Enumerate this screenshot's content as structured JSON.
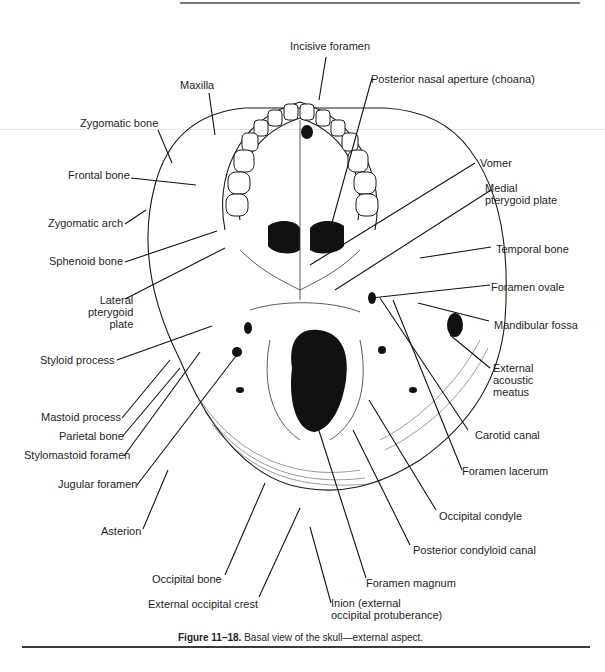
{
  "figure": {
    "number": "Figure 11–18.",
    "caption": "Basal view of the skull—external aspect."
  },
  "labels": {
    "incisive_foramen": "Incisive foramen",
    "posterior_nasal_aperture": "Posterior nasal aperture (choana)",
    "maxilla": "Maxilla",
    "zygomatic_bone": "Zygomatic bone",
    "frontal_bone": "Frontal bone",
    "zygomatic_arch": "Zygomatic arch",
    "sphenoid_bone": "Sphenoid bone",
    "lateral_pterygoid_plate": "Lateral\npterygoid\nplate",
    "styloid_process": "Styloid process",
    "mastoid_process": "Mastoid process",
    "parietal_bone": "Parietal bone",
    "stylomastoid_foramen": "Stylomastoid foramen",
    "jugular_foramen": "Jugular foramen",
    "asterion": "Asterion",
    "occipital_bone": "Occipital bone",
    "external_occipital_crest": "External occipital crest",
    "inion": "Inion (external\noccipital protuberance)",
    "foramen_magnum": "Foramen magnum",
    "posterior_condyloid_canal": "Posterior condyloid canal",
    "occipital_condyle": "Occipital condyle",
    "foramen_lacerum": "Foramen lacerum",
    "carotid_canal": "Carotid canal",
    "external_acoustic_meatus": "External\nacoustic\nmeatus",
    "mandibular_fossa": "Mandibular fossa",
    "foramen_ovale": "Foramen ovale",
    "temporal_bone": "Temporal bone",
    "medial_pterygoid_plate": "Medial\npterygoid plate",
    "vomer": "Vomer"
  },
  "colors": {
    "ink": "#1a1a1a",
    "rule": "#4a4a4a",
    "paper": "#ffffff"
  }
}
